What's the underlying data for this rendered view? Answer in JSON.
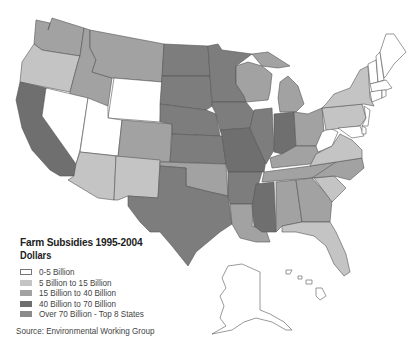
{
  "legend": {
    "title": "Farm Subsidies 1995-2004",
    "subtitle": "Dollars",
    "items": [
      {
        "label": "0-5 Billion",
        "color": "#ffffff",
        "border": "#777777"
      },
      {
        "label": "5 Billion to 15 Billion",
        "color": "#c4c4c4",
        "border": "#c4c4c4"
      },
      {
        "label": "15 Billion to 40 Billion",
        "color": "#a2a2a2",
        "border": "#a2a2a2"
      },
      {
        "label": "40 Billion to 70 Billion",
        "color": "#6e6e6e",
        "border": "#6e6e6e"
      },
      {
        "label": "Over 70 Billion - Top 8 States",
        "color": "#8a8a8a",
        "border": "#8a8a8a"
      }
    ]
  },
  "source": "Source: Environmental Working Group",
  "colors": {
    "tier0": "#ffffff",
    "tier1": "#c4c4c4",
    "tier2": "#a2a2a2",
    "tier3": "#6f6f6f",
    "tier4": "#7d7d7d",
    "outline": "#555555"
  }
}
